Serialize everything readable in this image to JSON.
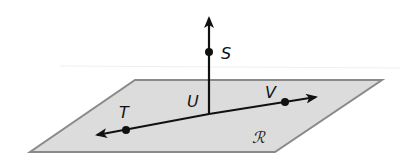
{
  "diagram": {
    "type": "geometry-plane-lines",
    "colors": {
      "plane_fill": "#dcdcdc",
      "plane_stroke": "#8a8a8a",
      "line": "#111111",
      "faint_horizon": "#eeeeee"
    },
    "plane": {
      "label": "ℛ",
      "label_pos": [
        258,
        143
      ],
      "vertices": [
        [
          135,
          80
        ],
        [
          382,
          80
        ],
        [
          275,
          152
        ],
        [
          30,
          152
        ]
      ]
    },
    "points": [
      {
        "name": "S",
        "label": "S",
        "x": 209,
        "y": 52,
        "label_pos": [
          221,
          59
        ]
      },
      {
        "name": "U",
        "label": "U",
        "x": 209,
        "y": 114,
        "label_pos": [
          187,
          107
        ],
        "marked": false
      },
      {
        "name": "T",
        "label": "T",
        "x": 126,
        "y": 130,
        "label_pos": [
          119,
          118
        ]
      },
      {
        "name": "V",
        "label": "V",
        "x": 285,
        "y": 102,
        "label_pos": [
          265,
          98
        ]
      }
    ],
    "lines": [
      {
        "name": "ray-US",
        "from": [
          209,
          114
        ],
        "to": [
          209,
          18
        ],
        "arrow_end": true
      },
      {
        "name": "line-TV",
        "from": [
          97,
          135
        ],
        "to": [
          316,
          97
        ],
        "arrow_start": true,
        "arrow_end": true
      }
    ]
  }
}
